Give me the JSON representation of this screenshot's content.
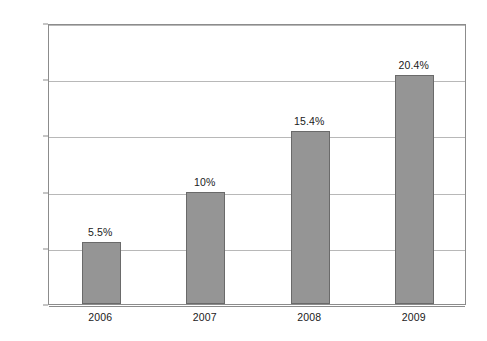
{
  "chart_data": {
    "type": "bar",
    "title": "",
    "subtitle": "",
    "xlabel": "",
    "ylabel": "",
    "categories": [
      "2006",
      "2007",
      "2008",
      "2009"
    ],
    "values": [
      5.5,
      10.0,
      15.4,
      20.4
    ],
    "data_labels": [
      "5.5%",
      "10%",
      "15.4%",
      "20.4%"
    ],
    "ylim": [
      0,
      25
    ],
    "ytick_values": [
      0,
      5,
      10,
      15,
      20,
      25
    ],
    "ytick_labels": [
      "0%",
      "5%",
      "10%",
      "15%",
      "20%",
      "25%"
    ],
    "grid": true,
    "legend": false,
    "legend_position": "none",
    "series": [
      {
        "name": "",
        "values": [
          5.5,
          10.0,
          15.4,
          20.4
        ]
      }
    ],
    "colors": {
      "bar_fill": "#959595",
      "bar_border": "#6a6a6a",
      "gridline": "#b8b8b8",
      "axis": "#8c8c8c",
      "background": "#ffffff",
      "text": "#1a1a1a"
    }
  }
}
